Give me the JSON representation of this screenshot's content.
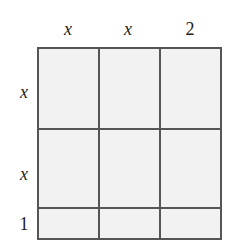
{
  "diagram": {
    "type": "area-model",
    "top_labels": [
      "x",
      "x",
      "2"
    ],
    "side_labels": [
      "x",
      "x",
      "1"
    ],
    "rows": 3,
    "columns": 3,
    "colors": {
      "border": "#555555",
      "fill": "#f2f2f2",
      "text": "#222222"
    }
  }
}
